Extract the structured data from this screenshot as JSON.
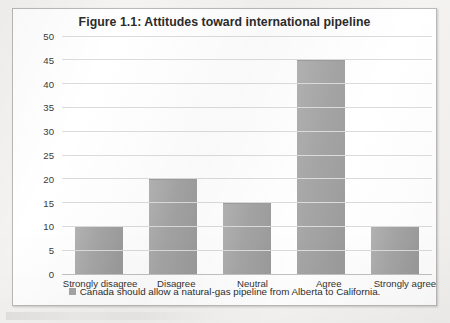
{
  "chart_data": {
    "type": "bar",
    "title": "Figure 1.1: Attitudes toward international pipeline",
    "categories": [
      "Strongly disagree",
      "Disagree",
      "Neutral",
      "Agree",
      "Strongly agree"
    ],
    "values": [
      10,
      20,
      15,
      45,
      10
    ],
    "series": [
      {
        "name": "Canada should allow a natural-gas pipeline from Alberta to California.",
        "values": [
          10,
          20,
          15,
          45,
          10
        ]
      }
    ],
    "xlabel": "",
    "ylabel": "",
    "ylim": [
      0,
      50
    ],
    "ytick_step": 5,
    "yticks": [
      "50",
      "45",
      "40",
      "35",
      "30",
      "25",
      "20",
      "15",
      "10",
      "5",
      "0"
    ],
    "grid": true,
    "legend_position": "bottom",
    "legend": [
      {
        "label": "Canada should allow a natural-gas pipeline from Alberta to California.",
        "color": "#a6a6a6"
      }
    ],
    "colors": {
      "bar_fill": "#a6a6a6",
      "gridline": "#dcdcdc",
      "frame_border": "#b9b9b9",
      "plot_background": "#ffffff",
      "page_background": "#f4f3f2",
      "text": "#2e2e2e"
    }
  }
}
